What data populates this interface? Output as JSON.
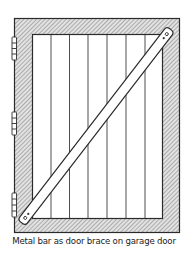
{
  "figure": {
    "caption": "Metal bar as door brace on garage door",
    "colors": {
      "line": "#2b2b2b",
      "frame_hatch": "#8a8a8a",
      "frame_fill": "#d6d6d6",
      "panel": "#ffffff",
      "bar": "#ffffff"
    },
    "parts": [
      {
        "name": "door-frame",
        "label": "hatched outer frame"
      },
      {
        "name": "plank-panel",
        "label": "vertical board panel",
        "plank_count": 7
      },
      {
        "name": "metal-bar",
        "label": "diagonal metal bar brace"
      },
      {
        "name": "hinges",
        "label": "hinges",
        "count": 3
      }
    ]
  }
}
